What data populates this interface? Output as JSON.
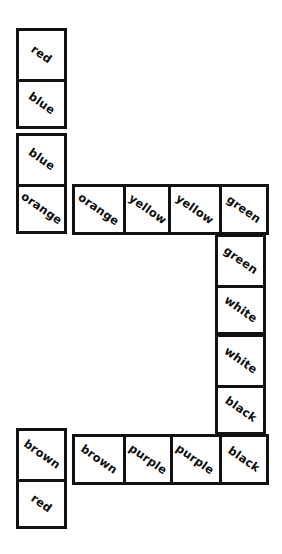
{
  "puzzle": {
    "title": "Domino Chain",
    "board": {
      "width": 282,
      "height": 554,
      "background": "#ffffff"
    },
    "style": {
      "ink": "#111111",
      "tile_fill": "#ffffff",
      "label_rotation_deg": 35,
      "border_width_px": 3,
      "half_short_px": 51,
      "half_long_px": 101
    },
    "dominoes": [
      {
        "id": "domino-1",
        "orientation": "vertical",
        "x": 16,
        "y": 28,
        "w": 51,
        "h": 101,
        "halves": [
          {
            "label": "red"
          },
          {
            "label": "blue"
          }
        ]
      },
      {
        "id": "domino-2",
        "orientation": "vertical",
        "x": 16,
        "y": 133,
        "w": 51,
        "h": 101,
        "halves": [
          {
            "label": "blue"
          },
          {
            "label": "orange"
          }
        ]
      },
      {
        "id": "domino-3",
        "orientation": "horizontal",
        "x": 72,
        "y": 184,
        "w": 101,
        "h": 51,
        "halves": [
          {
            "label": "orange"
          },
          {
            "label": "yellow"
          }
        ]
      },
      {
        "id": "domino-4",
        "orientation": "horizontal",
        "x": 168,
        "y": 184,
        "w": 101,
        "h": 51,
        "halves": [
          {
            "label": "yellow"
          },
          {
            "label": "green"
          }
        ]
      },
      {
        "id": "domino-5",
        "orientation": "vertical",
        "x": 215,
        "y": 234,
        "w": 51,
        "h": 101,
        "halves": [
          {
            "label": "green"
          },
          {
            "label": "white"
          }
        ]
      },
      {
        "id": "domino-6",
        "orientation": "vertical",
        "x": 215,
        "y": 334,
        "w": 51,
        "h": 101,
        "halves": [
          {
            "label": "white"
          },
          {
            "label": "black"
          }
        ]
      },
      {
        "id": "domino-7",
        "orientation": "horizontal",
        "x": 168,
        "y": 434,
        "w": 101,
        "h": 51,
        "halves": [
          {
            "label": "purple"
          },
          {
            "label": "black"
          }
        ]
      },
      {
        "id": "domino-8",
        "orientation": "horizontal",
        "x": 72,
        "y": 434,
        "w": 101,
        "h": 51,
        "halves": [
          {
            "label": "brown"
          },
          {
            "label": "purple"
          }
        ]
      },
      {
        "id": "domino-9",
        "orientation": "vertical",
        "x": 16,
        "y": 428,
        "w": 51,
        "h": 101,
        "halves": [
          {
            "label": "brown"
          },
          {
            "label": "red"
          }
        ]
      }
    ]
  }
}
